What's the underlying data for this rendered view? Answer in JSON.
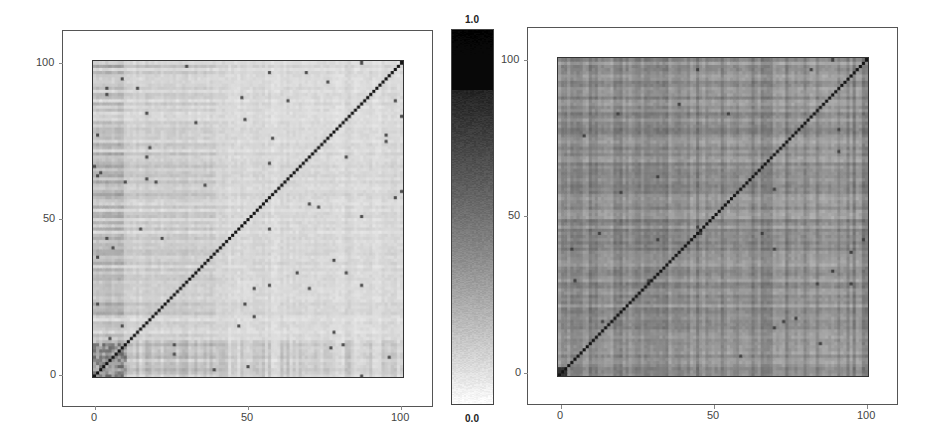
{
  "chart_data": [
    {
      "type": "heatmap",
      "panel": "left",
      "title": "",
      "xlabel": "",
      "ylabel": "",
      "matrix_size": 101,
      "xlim": [
        0,
        100
      ],
      "ylim": [
        0,
        100
      ],
      "x_ticks": [
        "0",
        "50",
        "100"
      ],
      "y_ticks": [
        "0",
        "50",
        "100"
      ],
      "x_tick_values": [
        0,
        50,
        100
      ],
      "y_tick_values": [
        0,
        50,
        100
      ],
      "background_level": 0.08,
      "diagonal_value": 1.0,
      "description": "Mostly light (near 0) correlation-like matrix with a dark diagonal; darker block near origin (indices 0-10), scattered dark points and faint row/column stripes",
      "notable_features": {
        "dark_block_origin": {
          "range": [
            0,
            10
          ],
          "level": 0.55
        },
        "scattered_points_level": 0.7
      }
    },
    {
      "type": "heatmap",
      "panel": "right",
      "title": "",
      "xlabel": "",
      "ylabel": "",
      "matrix_size": 101,
      "xlim": [
        0,
        100
      ],
      "ylim": [
        0,
        100
      ],
      "x_ticks": [
        "0",
        "50",
        "100"
      ],
      "y_ticks": [
        "0",
        "50",
        "100"
      ],
      "x_tick_values": [
        0,
        50,
        100
      ],
      "y_tick_values": [
        0,
        50,
        100
      ],
      "background_level": 0.45,
      "diagonal_value": 1.0,
      "description": "Uniform medium-gray matrix with plaid row/column stripes and a dark diagonal; darker spot at origin",
      "notable_features": {
        "dark_block_origin": {
          "range": [
            0,
            2
          ],
          "level": 0.8
        }
      }
    }
  ],
  "colorbar": {
    "max_label": "1.0",
    "min_label": "0.0",
    "range": [
      0.0,
      1.0
    ],
    "colormap": "gray_r",
    "top_color": "#000000",
    "bottom_color": "#ffffff"
  },
  "panels": {
    "left": {
      "y_ticks": [
        "100",
        "50",
        "0"
      ],
      "x_ticks": [
        "0",
        "50",
        "100"
      ]
    },
    "right": {
      "y_ticks": [
        "100",
        "50",
        "0"
      ],
      "x_ticks": [
        "0",
        "50",
        "100"
      ]
    }
  }
}
